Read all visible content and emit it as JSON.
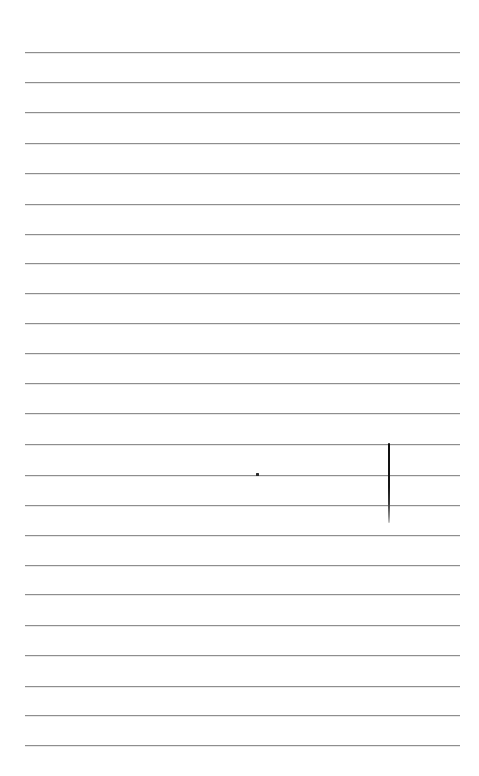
{
  "document": {
    "kind": "ruled-notebook-page",
    "page_width": 479,
    "page_height": 776,
    "background_color": "#ffffff",
    "rule_color": "#8e8e8e",
    "ink_color": "#111111"
  },
  "ruled_lines": {
    "count": 24,
    "left_x": 25,
    "right_x": 460,
    "first_y": 52,
    "spacing": 30.1,
    "thickness": 1,
    "y_positions": [
      52,
      82,
      112,
      143,
      173,
      204,
      234,
      263,
      293,
      323,
      353,
      383,
      413,
      444,
      475,
      505,
      535,
      565,
      594,
      625,
      655,
      686,
      715,
      745
    ]
  },
  "marks": [
    {
      "name": "vertical-pen-stroke",
      "type": "stroke",
      "x": 388,
      "y_top": 443,
      "y_bottom": 523,
      "width": 2,
      "color": "#111111"
    },
    {
      "name": "ink-dot",
      "type": "dot",
      "x": 256,
      "y": 473,
      "size": 3,
      "color": "#2a2a2a"
    }
  ],
  "text": {
    "body_content": "",
    "note": ""
  }
}
